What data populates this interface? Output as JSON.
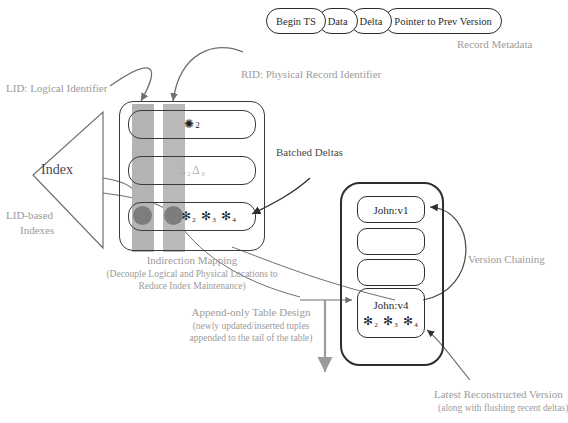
{
  "diagram": {
    "record_metadata": {
      "caption": "Record Metadata",
      "fields": [
        {
          "label": "Begin TS"
        },
        {
          "label": "Data"
        },
        {
          "label": "Delta"
        },
        {
          "label": "Pointer to Prev Version"
        }
      ]
    },
    "labels": {
      "lid": "LID: Logical Identifier",
      "rid": "RID: Physical Record Identifier",
      "batched_deltas": "Batched Deltas",
      "index": "Index",
      "lid_based_indexes_line1": "LID-based",
      "lid_based_indexes_line2": "Indexes",
      "version_chaining": "Version Chaining"
    },
    "captions": {
      "indirection_title": "Indirection Mapping",
      "indirection_sub_line1": "(Decouple Logical and Physical Locations to",
      "indirection_sub_line2": "Reduce Index Maintenance)",
      "append_title": "Append-only Table Design",
      "append_sub_line1": "(newly updated/inserted tuples",
      "append_sub_line2": "appended to the tail of the table)",
      "latest_title": "Latest Reconstructed Version",
      "latest_sub": "(along with flushing recent deltas)"
    },
    "mapping_rows": [
      {
        "name": "row-gear",
        "symbol": "✺",
        "subscript": "2",
        "tone": "k"
      },
      {
        "name": "row-deltas",
        "symbol": "Δ₂Δ₃",
        "subscript": "",
        "tone": "g"
      },
      {
        "name": "row-asterisks",
        "symbol": "✻₂ ✻₃ ✻₄",
        "subscript": "",
        "tone": "k"
      }
    ],
    "table_slots": [
      {
        "name": "slot-john-v1",
        "label": "John:v1",
        "symbols": ""
      },
      {
        "name": "slot-empty-1",
        "label": "",
        "symbols": ""
      },
      {
        "name": "slot-empty-2",
        "label": "",
        "symbols": ""
      },
      {
        "name": "slot-john-v4",
        "label": "John:v4",
        "symbols": "✻₂ ✻₃ ✻₄"
      }
    ],
    "colors": {
      "ink": "#2b2b2b",
      "label_gray": "#9b9b9b",
      "band_gray": "#b4b4b4",
      "dot_gray": "#7d7d7d",
      "paper": "#ffffff"
    }
  }
}
